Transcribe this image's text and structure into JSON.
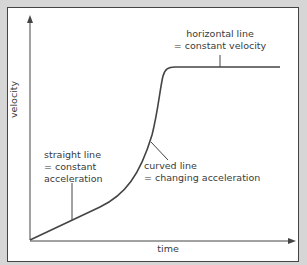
{
  "diagram": {
    "type": "velocity-time graph",
    "axes": {
      "x_label": "time",
      "y_label": "velocity"
    },
    "annotations": [
      {
        "id": "straight",
        "line1": "straight line",
        "line2": "= constant",
        "line3": "acceleration"
      },
      {
        "id": "curved",
        "line1": "curved line",
        "line2": "= changing acceleration"
      },
      {
        "id": "horizontal",
        "line1": "horizontal line",
        "line2": "= constant velocity"
      }
    ],
    "colors": {
      "background": "#d6d6d6",
      "panel": "#ffffff",
      "line": "#444444",
      "text": "#3a3a3a"
    }
  }
}
